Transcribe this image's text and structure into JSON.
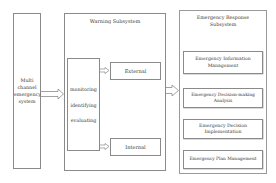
{
  "diagram": {
    "source": {
      "label_lines": [
        "Multi",
        "channel",
        "emergency",
        "system"
      ]
    },
    "warning_subsystem": {
      "title": "Warning Subsystem",
      "process": {
        "steps": [
          "monitoring",
          "identifying",
          "evaluating"
        ]
      },
      "outputs": [
        {
          "label": "External"
        },
        {
          "label": "Internal"
        }
      ]
    },
    "response_subsystem": {
      "title_lines": [
        "Emergency Response",
        "Subsystem"
      ],
      "modules": [
        {
          "lines": [
            "Emergency Information",
            "Management"
          ]
        },
        {
          "lines": [
            "Emergency Decision-making",
            "Analysis"
          ]
        },
        {
          "lines": [
            "Emergency Decision",
            "Implementation"
          ]
        },
        {
          "lines": [
            "Emergency Plan Management"
          ]
        }
      ]
    },
    "colors": {
      "border": "#8a8a8a",
      "text": "#3a3a3a",
      "background": "#ffffff"
    }
  }
}
